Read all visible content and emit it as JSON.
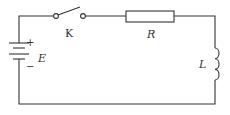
{
  "diagram": {
    "type": "circuit",
    "components": {
      "battery": {
        "label": "E",
        "plus": "+",
        "minus": "−"
      },
      "switch": {
        "label": "K",
        "state": "open"
      },
      "resistor": {
        "label": "R"
      },
      "inductor": {
        "label": "L"
      }
    },
    "colors": {
      "line": "#333333",
      "background": "#ffffff"
    }
  }
}
